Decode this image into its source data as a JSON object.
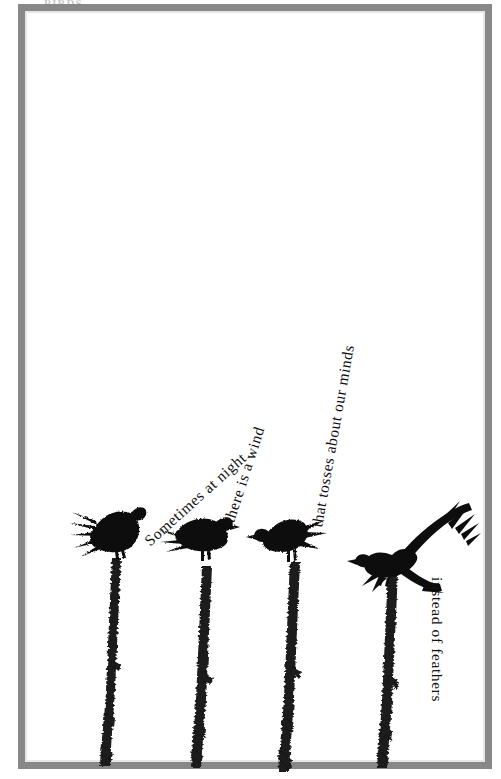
{
  "page": {
    "kind": "scanned-book-page",
    "background_color": "#ffffff",
    "frame_color": "#8a8a8a",
    "ink_color": "#111111",
    "top_bleed_text": "BIRDS"
  },
  "poem": {
    "full_text": "Sometimes at night there is a wind that tosses about our minds instead of feathers",
    "lines": [
      {
        "id": "line-1",
        "text": "Sometimes at night",
        "rotation_deg": -42
      },
      {
        "id": "line-2",
        "text": "there is a wind",
        "rotation_deg": -72
      },
      {
        "id": "line-3",
        "text": "that tosses about our minds",
        "rotation_deg": -80
      },
      {
        "id": "line-4",
        "text": "instead of feathers",
        "rotation_deg": 90
      }
    ]
  },
  "illustration": {
    "description": "Four black crow silhouettes perched on four vertical textured twigs",
    "birds": [
      {
        "id": "bird-1",
        "label": "crow-perched-tail-left",
        "facing": "right",
        "posture": "perched",
        "x": 72,
        "y": 510
      },
      {
        "id": "bird-2",
        "label": "crow-perched-facing-right",
        "facing": "right",
        "posture": "perched",
        "x": 168,
        "y": 521
      },
      {
        "id": "bird-3",
        "label": "crow-perched-facing-left",
        "facing": "left",
        "posture": "perched",
        "x": 255,
        "y": 518
      },
      {
        "id": "bird-4",
        "label": "crow-wings-spread",
        "facing": "left",
        "posture": "taking-off",
        "x": 372,
        "y": 503
      }
    ],
    "branches": [
      {
        "id": "branch-1",
        "x": 110,
        "top": 558
      },
      {
        "id": "branch-2",
        "x": 200,
        "top": 566
      },
      {
        "id": "branch-3",
        "x": 288,
        "top": 562
      },
      {
        "id": "branch-4",
        "x": 385,
        "top": 572
      }
    ]
  }
}
